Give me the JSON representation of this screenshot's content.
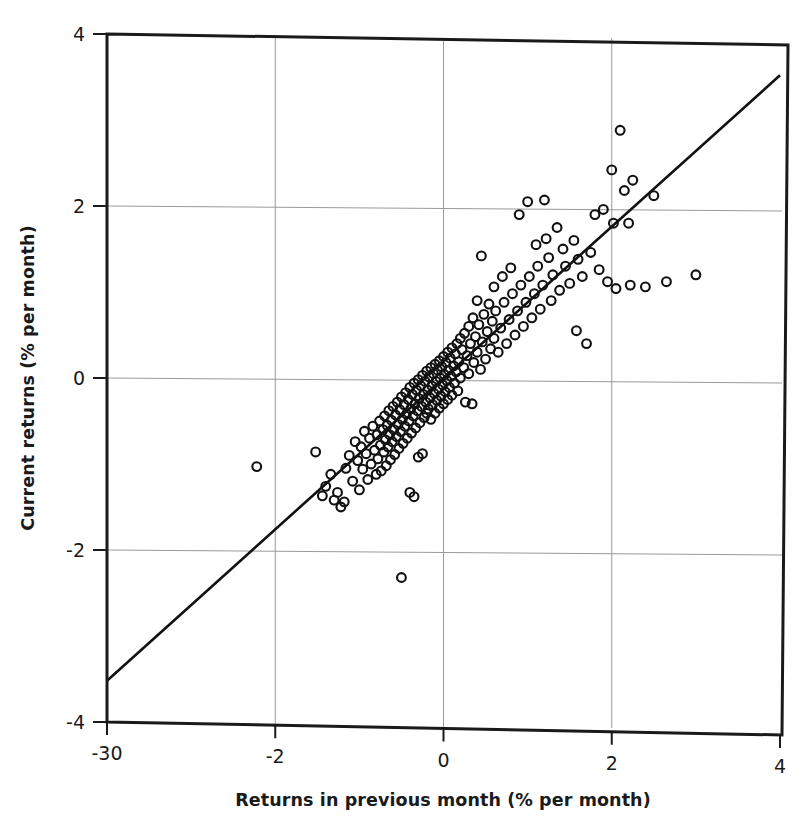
{
  "chart_data": {
    "type": "scatter",
    "title": "",
    "xlabel": "Returns in previous month (% per month)",
    "ylabel": "Current returns (% per month)",
    "xlim": [
      -4,
      4
    ],
    "ylim": [
      -4,
      4
    ],
    "grid": true,
    "legend": "none",
    "x_tick_values": [
      -4,
      -2,
      0,
      2,
      4
    ],
    "x_tick_labels": [
      "-30",
      "-2",
      "0",
      "2",
      "4"
    ],
    "y_tick_values": [
      4,
      2,
      0,
      -2,
      -4
    ],
    "y_tick_labels": [
      "4",
      "2",
      "0",
      "-2",
      "-4"
    ],
    "marker": {
      "shape": "open-circle",
      "radius_px": 4.4,
      "stroke": "#111111",
      "stroke_width_px": 2.1,
      "fill": "none"
    },
    "fit_line": {
      "label": "regression-line",
      "color": "#111111",
      "width_px": 2.6,
      "x_start": -4.0,
      "y_start": -3.52,
      "x_end": 4.0,
      "y_end": 3.52,
      "slope": 0.88,
      "intercept": 0.0
    },
    "frame": {
      "color": "#1a1a1a",
      "width_px": 3,
      "gridline_color": "#9a9a9a",
      "gridline_width_px": 1
    },
    "points": [
      [
        -2.22,
        -1.03
      ],
      [
        -1.52,
        -0.86
      ],
      [
        -1.44,
        -1.37
      ],
      [
        -1.4,
        -1.26
      ],
      [
        -1.34,
        -1.12
      ],
      [
        -1.3,
        -1.42
      ],
      [
        -1.26,
        -1.33
      ],
      [
        -1.22,
        -1.5
      ],
      [
        -1.18,
        -1.44
      ],
      [
        -1.16,
        -1.05
      ],
      [
        -1.12,
        -0.9
      ],
      [
        -1.08,
        -1.2
      ],
      [
        -1.05,
        -0.74
      ],
      [
        -1.02,
        -0.96
      ],
      [
        -1.0,
        -1.3
      ],
      [
        -0.98,
        -0.8
      ],
      [
        -0.96,
        -1.06
      ],
      [
        -0.94,
        -0.62
      ],
      [
        -0.92,
        -0.88
      ],
      [
        -0.9,
        -1.18
      ],
      [
        -0.88,
        -0.7
      ],
      [
        -0.86,
        -1.0
      ],
      [
        -0.84,
        -0.56
      ],
      [
        -0.82,
        -0.84
      ],
      [
        -0.8,
        -1.12
      ],
      [
        -0.79,
        -0.66
      ],
      [
        -0.78,
        -0.94
      ],
      [
        -0.76,
        -0.5
      ],
      [
        -0.75,
        -0.78
      ],
      [
        -0.74,
        -1.08
      ],
      [
        -0.72,
        -0.6
      ],
      [
        -0.71,
        -0.86
      ],
      [
        -0.7,
        -0.44
      ],
      [
        -0.69,
        -0.72
      ],
      [
        -0.68,
        -1.02
      ],
      [
        -0.67,
        -0.55
      ],
      [
        -0.66,
        -0.8
      ],
      [
        -0.65,
        -0.38
      ],
      [
        -0.64,
        -0.66
      ],
      [
        -0.63,
        -0.95
      ],
      [
        -0.62,
        -0.49
      ],
      [
        -0.61,
        -0.74
      ],
      [
        -0.6,
        -0.33
      ],
      [
        -0.59,
        -0.6
      ],
      [
        -0.58,
        -0.89
      ],
      [
        -0.57,
        -0.43
      ],
      [
        -0.56,
        -0.68
      ],
      [
        -0.55,
        -0.28
      ],
      [
        -0.54,
        -0.54
      ],
      [
        -0.53,
        -0.82
      ],
      [
        -0.52,
        -0.37
      ],
      [
        -0.51,
        -0.62
      ],
      [
        -0.5,
        -0.22
      ],
      [
        -0.5,
        -2.32
      ],
      [
        -0.49,
        -0.48
      ],
      [
        -0.48,
        -0.76
      ],
      [
        -0.47,
        -0.31
      ],
      [
        -0.46,
        -0.56
      ],
      [
        -0.45,
        -0.17
      ],
      [
        -0.44,
        -0.42
      ],
      [
        -0.43,
        -0.7
      ],
      [
        -0.42,
        -0.25
      ],
      [
        -0.41,
        -0.5
      ],
      [
        -0.4,
        -0.11
      ],
      [
        -0.4,
        -1.33
      ],
      [
        -0.39,
        -0.36
      ],
      [
        -0.38,
        -0.64
      ],
      [
        -0.37,
        -0.19
      ],
      [
        -0.36,
        -0.44
      ],
      [
        -0.35,
        -0.06
      ],
      [
        -0.35,
        -1.38
      ],
      [
        -0.34,
        -0.3
      ],
      [
        -0.33,
        -0.58
      ],
      [
        -0.32,
        -0.14
      ],
      [
        -0.31,
        -0.38
      ],
      [
        -0.3,
        -0.02
      ],
      [
        -0.3,
        -0.92
      ],
      [
        -0.29,
        -0.24
      ],
      [
        -0.28,
        -0.52
      ],
      [
        -0.27,
        -0.09
      ],
      [
        -0.26,
        -0.33
      ],
      [
        -0.25,
        0.03
      ],
      [
        -0.25,
        -0.88
      ],
      [
        -0.24,
        -0.19
      ],
      [
        -0.23,
        -0.46
      ],
      [
        -0.22,
        -0.04
      ],
      [
        -0.21,
        -0.28
      ],
      [
        -0.2,
        0.08
      ],
      [
        -0.2,
        -0.41
      ],
      [
        -0.19,
        -0.14
      ],
      [
        -0.18,
        -0.36
      ],
      [
        -0.17,
        0.01
      ],
      [
        -0.16,
        -0.23
      ],
      [
        -0.15,
        0.12
      ],
      [
        -0.15,
        -0.48
      ],
      [
        -0.14,
        -0.09
      ],
      [
        -0.13,
        -0.31
      ],
      [
        -0.12,
        0.05
      ],
      [
        -0.11,
        -0.18
      ],
      [
        -0.1,
        0.16
      ],
      [
        -0.1,
        -0.41
      ],
      [
        -0.09,
        -0.04
      ],
      [
        -0.08,
        -0.26
      ],
      [
        -0.07,
        0.09
      ],
      [
        -0.06,
        -0.13
      ],
      [
        -0.05,
        0.2
      ],
      [
        -0.05,
        -0.35
      ],
      [
        -0.04,
        0.0
      ],
      [
        -0.03,
        -0.21
      ],
      [
        -0.02,
        0.13
      ],
      [
        -0.01,
        -0.08
      ],
      [
        0.0,
        0.25
      ],
      [
        0.0,
        -0.3
      ],
      [
        0.01,
        0.04
      ],
      [
        0.02,
        -0.16
      ],
      [
        0.03,
        0.18
      ],
      [
        0.04,
        -0.03
      ],
      [
        0.05,
        0.3
      ],
      [
        0.05,
        -0.25
      ],
      [
        0.06,
        0.09
      ],
      [
        0.07,
        -0.11
      ],
      [
        0.08,
        0.23
      ],
      [
        0.09,
        0.02
      ],
      [
        0.1,
        0.35
      ],
      [
        0.1,
        -0.2
      ],
      [
        0.12,
        0.14
      ],
      [
        0.13,
        -0.06
      ],
      [
        0.14,
        0.28
      ],
      [
        0.15,
        0.07
      ],
      [
        0.16,
        0.4
      ],
      [
        0.17,
        -0.15
      ],
      [
        0.18,
        0.19
      ],
      [
        0.2,
        0.46
      ],
      [
        0.2,
        0.0
      ],
      [
        0.22,
        0.33
      ],
      [
        0.24,
        0.12
      ],
      [
        0.25,
        0.52
      ],
      [
        0.26,
        -0.28
      ],
      [
        0.28,
        0.26
      ],
      [
        0.3,
        0.6
      ],
      [
        0.3,
        0.05
      ],
      [
        0.32,
        0.4
      ],
      [
        0.34,
        -0.3
      ],
      [
        0.35,
        0.7
      ],
      [
        0.36,
        0.18
      ],
      [
        0.38,
        0.48
      ],
      [
        0.4,
        0.9
      ],
      [
        0.4,
        0.3
      ],
      [
        0.42,
        0.62
      ],
      [
        0.44,
        0.1
      ],
      [
        0.45,
        1.42
      ],
      [
        0.46,
        0.42
      ],
      [
        0.48,
        0.74
      ],
      [
        0.5,
        0.22
      ],
      [
        0.52,
        0.54
      ],
      [
        0.54,
        0.86
      ],
      [
        0.56,
        0.34
      ],
      [
        0.58,
        0.66
      ],
      [
        0.6,
        1.06
      ],
      [
        0.6,
        0.46
      ],
      [
        0.62,
        0.78
      ],
      [
        0.65,
        0.3
      ],
      [
        0.68,
        0.58
      ],
      [
        0.7,
        1.18
      ],
      [
        0.72,
        0.88
      ],
      [
        0.75,
        0.4
      ],
      [
        0.78,
        0.68
      ],
      [
        0.8,
        1.28
      ],
      [
        0.82,
        0.98
      ],
      [
        0.85,
        0.5
      ],
      [
        0.88,
        0.78
      ],
      [
        0.9,
        1.9
      ],
      [
        0.92,
        1.08
      ],
      [
        0.95,
        0.6
      ],
      [
        0.98,
        0.88
      ],
      [
        1.0,
        2.05
      ],
      [
        1.02,
        1.18
      ],
      [
        1.05,
        0.7
      ],
      [
        1.08,
        0.98
      ],
      [
        1.1,
        1.55
      ],
      [
        1.12,
        1.3
      ],
      [
        1.15,
        0.8
      ],
      [
        1.18,
        1.08
      ],
      [
        1.2,
        2.07
      ],
      [
        1.22,
        1.62
      ],
      [
        1.25,
        1.4
      ],
      [
        1.28,
        0.9
      ],
      [
        1.3,
        1.2
      ],
      [
        1.35,
        1.75
      ],
      [
        1.38,
        1.02
      ],
      [
        1.42,
        1.5
      ],
      [
        1.45,
        1.3
      ],
      [
        1.5,
        1.1
      ],
      [
        1.55,
        1.6
      ],
      [
        1.58,
        0.55
      ],
      [
        1.6,
        1.38
      ],
      [
        1.65,
        1.18
      ],
      [
        1.7,
        0.4
      ],
      [
        1.75,
        1.46
      ],
      [
        1.8,
        1.9
      ],
      [
        1.85,
        1.26
      ],
      [
        1.9,
        1.96
      ],
      [
        1.95,
        1.12
      ],
      [
        2.0,
        2.42
      ],
      [
        2.02,
        1.8
      ],
      [
        2.05,
        1.04
      ],
      [
        2.1,
        2.88
      ],
      [
        2.15,
        2.18
      ],
      [
        2.2,
        1.8
      ],
      [
        2.22,
        1.08
      ],
      [
        2.25,
        2.3
      ],
      [
        2.4,
        1.06
      ],
      [
        2.5,
        2.12
      ],
      [
        2.65,
        1.12
      ],
      [
        3.0,
        1.2
      ]
    ]
  }
}
